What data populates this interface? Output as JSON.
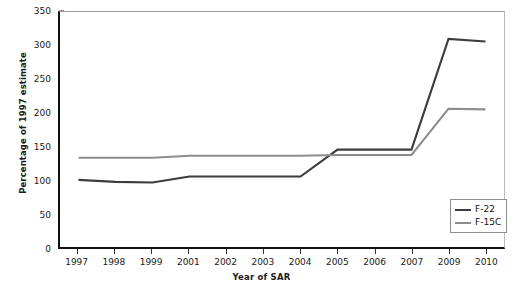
{
  "chart_data": {
    "type": "line",
    "title": "",
    "xlabel": "Year of SAR",
    "ylabel": "Percentage of 1997 estimate",
    "categories": [
      "1997",
      "1998",
      "1999",
      "2001",
      "2002",
      "2003",
      "2004",
      "2005",
      "2006",
      "2007",
      "2009",
      "2010"
    ],
    "ylim": [
      0,
      350
    ],
    "yticks": [
      0,
      50,
      100,
      150,
      200,
      250,
      300,
      350
    ],
    "ytick_labels": [
      "0",
      "50",
      "100",
      "150",
      "200",
      "250",
      "300",
      "350"
    ],
    "grid": false,
    "legend_position": "lower-right",
    "series": [
      {
        "name": "F-22",
        "color": "#3c3c3c",
        "width": 2.1,
        "values": [
          100,
          97,
          96,
          105,
          105,
          105,
          105,
          145,
          145,
          145,
          310,
          306
        ]
      },
      {
        "name": "F-15C",
        "color": "#8c8c8c",
        "width": 2.1,
        "values": [
          133,
          133,
          133,
          136,
          136,
          136,
          136,
          137,
          137,
          137,
          206,
          205
        ]
      }
    ]
  },
  "legend": {
    "items": [
      {
        "label": "F-22",
        "color": "#3c3c3c"
      },
      {
        "label": "F-15C",
        "color": "#8c8c8c"
      }
    ]
  },
  "axes": {
    "x_title": "Year of SAR",
    "y_title": "Percentage of 1997 estimate"
  }
}
